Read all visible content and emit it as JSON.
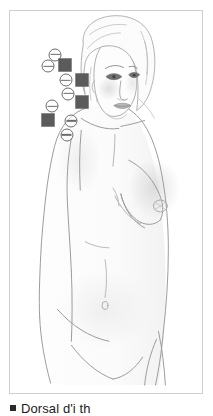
{
  "figure": {
    "caption": {
      "bullet": "square-bullet",
      "text": "Dorsal d'i  th"
    },
    "frame": {
      "border_color": "#cfcfcf",
      "background_color": "#fefefe"
    },
    "illustration": {
      "subject": "female-torso-pencil-sketch",
      "view": "anterior-oblique",
      "style": "graphite pencil line drawing with soft shading",
      "line_color": "#8c8c8c",
      "shade_color": "#b9b9b9",
      "hair_color": "#cbcbcb"
    },
    "legend": {
      "circle_symbol": "circle-with-horizontal-bar",
      "circle_color": "#6d6d6d",
      "square_symbol": "filled-square",
      "square_color": "#5b5b5b"
    },
    "markers": [
      {
        "id": "c1",
        "type": "circle",
        "x": 45.5,
        "y": 43.8
      },
      {
        "id": "s1",
        "type": "square",
        "x": 56.0,
        "y": 54.0
      },
      {
        "id": "c2",
        "type": "circle",
        "x": 38.5,
        "y": 55.5
      },
      {
        "id": "c3",
        "type": "circle",
        "x": 56.5,
        "y": 69.5
      },
      {
        "id": "s2",
        "type": "square",
        "x": 73.0,
        "y": 69.0
      },
      {
        "id": "c4",
        "type": "circle",
        "x": 59.0,
        "y": 83.0
      },
      {
        "id": "s3",
        "type": "square",
        "x": 72.5,
        "y": 91.5
      },
      {
        "id": "c5",
        "type": "circle",
        "x": 42.5,
        "y": 95.5
      },
      {
        "id": "s4",
        "type": "square",
        "x": 38.0,
        "y": 109.5
      },
      {
        "id": "c6",
        "type": "circle",
        "x": 62.0,
        "y": 110.5
      },
      {
        "id": "c7",
        "type": "circle",
        "x": 57.5,
        "y": 124.5
      }
    ]
  }
}
